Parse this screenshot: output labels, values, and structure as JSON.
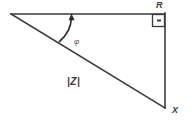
{
  "diagram": {
    "type": "right-triangle-vector-diagram",
    "stroke_color": "#3b3b3b",
    "background_color": "#ffffff",
    "labels": {
      "horizontal_leg": "R",
      "vertical_leg": "X",
      "hypotenuse": "|Z|",
      "angle": "φ"
    },
    "markers": {
      "right_angle": "right-angle-square",
      "angle_arrow": "curved-arrow"
    },
    "geometry": {
      "left_vertex": [
        11,
        14
      ],
      "top_right_vertex": [
        165,
        14
      ],
      "bottom_right_vertex": [
        165,
        108
      ],
      "right_angle_box": [
        152,
        14,
        13,
        13
      ],
      "arc_start": [
        60,
        40
      ],
      "arc_end": [
        72,
        15
      ]
    }
  }
}
